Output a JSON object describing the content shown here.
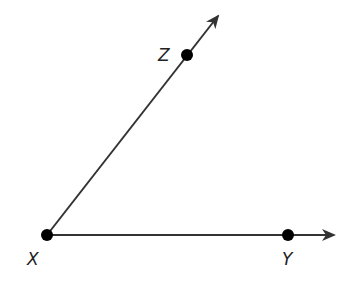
{
  "diagram": {
    "type": "angle",
    "vertex": {
      "label": "X",
      "x": 47,
      "y": 235
    },
    "rays": [
      {
        "name": "ray-XZ",
        "through": {
          "label": "Z",
          "x": 187,
          "y": 55
        },
        "arrow_tip": {
          "x": 218,
          "y": 16
        }
      },
      {
        "name": "ray-XY",
        "through": {
          "label": "Y",
          "x": 288,
          "y": 235
        },
        "arrow_tip": {
          "x": 334,
          "y": 235
        }
      }
    ],
    "labels": {
      "x": "X",
      "y": "Y",
      "z": "Z"
    },
    "colors": {
      "line": "#333333",
      "point": "#000000"
    }
  }
}
